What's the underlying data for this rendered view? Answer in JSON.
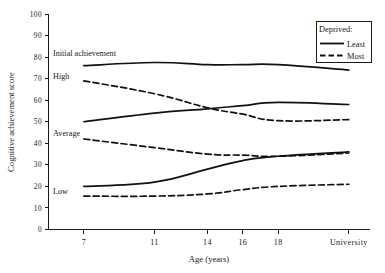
{
  "chart_data": {
    "type": "line",
    "title": "",
    "xlabel": "Age (years)",
    "ylabel": "Cognitive achievement score",
    "categories": [
      "7",
      "11",
      "14",
      "16",
      "18",
      "University"
    ],
    "x": [
      7,
      11,
      14,
      16,
      18,
      22
    ],
    "ylim": [
      0,
      100
    ],
    "xlim": [
      5,
      23.2
    ],
    "yticks": [
      0,
      10,
      20,
      30,
      40,
      50,
      60,
      70,
      80,
      90,
      100
    ],
    "ytick_labels": [
      "0",
      "10",
      "20",
      "30",
      "40",
      "50",
      "60",
      "70",
      "80",
      "90",
      "100"
    ],
    "grid": false,
    "legend_position": "top-right",
    "legend_title": "Deprived:",
    "legend_entries": [
      {
        "label": "Least",
        "style": "solid"
      },
      {
        "label": "Most",
        "style": "dashed"
      }
    ],
    "group_labels": [
      {
        "text": "Initial achievement",
        "value": 82
      },
      {
        "text": "High",
        "value": 71
      },
      {
        "text": "Average",
        "value": 45
      },
      {
        "text": "Low",
        "value": 18
      }
    ],
    "series": [
      {
        "name": "High – Least deprived",
        "group": "High",
        "deprived": "Least",
        "style": "solid",
        "values": [
          76,
          77.5,
          76.5,
          76.5,
          76.5,
          74
        ]
      },
      {
        "name": "High – Most deprived",
        "group": "High",
        "deprived": "Most",
        "style": "dashed",
        "values": [
          69,
          63,
          56.5,
          53.5,
          50.5,
          51
        ]
      },
      {
        "name": "Average – Least deprived",
        "group": "Average",
        "deprived": "Least",
        "style": "solid",
        "values": [
          50,
          54,
          56,
          57.5,
          59,
          58
        ]
      },
      {
        "name": "Average – Most deprived",
        "group": "Average",
        "deprived": "Most",
        "style": "dashed",
        "values": [
          42,
          38,
          35,
          34.5,
          34,
          35.5
        ]
      },
      {
        "name": "Low – Least deprived",
        "group": "Low",
        "deprived": "Least",
        "style": "solid",
        "values": [
          20,
          22,
          28,
          32,
          34,
          36
        ]
      },
      {
        "name": "Low – Most deprived",
        "group": "Low",
        "deprived": "Most",
        "style": "dashed",
        "values": [
          15.5,
          15.5,
          16.5,
          18.5,
          20,
          21
        ]
      }
    ]
  }
}
